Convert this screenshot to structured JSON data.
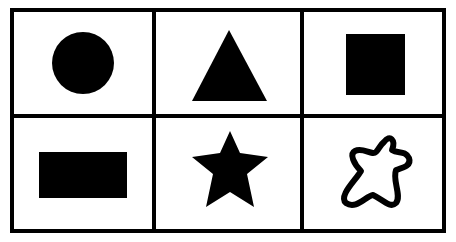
{
  "grid": {
    "rows": 2,
    "columns": 3,
    "border_color": "#000000",
    "background": "#ffffff",
    "cells": [
      {
        "row": 0,
        "col": 0,
        "shape": "circle",
        "style": "filled"
      },
      {
        "row": 0,
        "col": 1,
        "shape": "triangle",
        "style": "filled"
      },
      {
        "row": 0,
        "col": 2,
        "shape": "square",
        "style": "filled"
      },
      {
        "row": 1,
        "col": 0,
        "shape": "rectangle",
        "style": "filled"
      },
      {
        "row": 1,
        "col": 1,
        "shape": "star",
        "style": "filled"
      },
      {
        "row": 1,
        "col": 2,
        "shape": "irregular-blob",
        "style": "outline"
      }
    ]
  },
  "colors": {
    "shape_fill": "#000000",
    "line": "#000000"
  }
}
